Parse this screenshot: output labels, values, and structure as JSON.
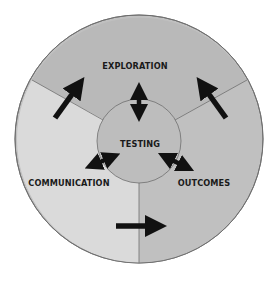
{
  "diagram": {
    "type": "cycle-diagram",
    "center": {
      "label": "TESTING"
    },
    "segments": [
      {
        "id": "exploration",
        "label": "EXPLORATION",
        "fill": "#b9b9b9"
      },
      {
        "id": "communication",
        "label": "COMMUNICATION",
        "fill": "#dadada"
      },
      {
        "id": "outcomes",
        "label": "OUTCOMES",
        "fill": "#c0c0c0"
      }
    ],
    "center_fill": "#bdbdbd",
    "stroke_color": "#6e6e6e",
    "arrow_color": "#111111",
    "arrows": [
      {
        "id": "communication-to-exploration",
        "type": "single",
        "from": "COMMUNICATION",
        "to": "EXPLORATION"
      },
      {
        "id": "outcomes-to-exploration",
        "type": "single",
        "from": "OUTCOMES",
        "to": "EXPLORATION"
      },
      {
        "id": "communication-to-outcomes",
        "type": "single",
        "from": "COMMUNICATION",
        "to": "OUTCOMES"
      },
      {
        "id": "testing-exploration",
        "type": "double",
        "between": [
          "TESTING",
          "EXPLORATION"
        ]
      },
      {
        "id": "testing-communication",
        "type": "double",
        "between": [
          "TESTING",
          "COMMUNICATION"
        ]
      },
      {
        "id": "testing-outcomes",
        "type": "double",
        "between": [
          "TESTING",
          "OUTCOMES"
        ]
      }
    ]
  }
}
